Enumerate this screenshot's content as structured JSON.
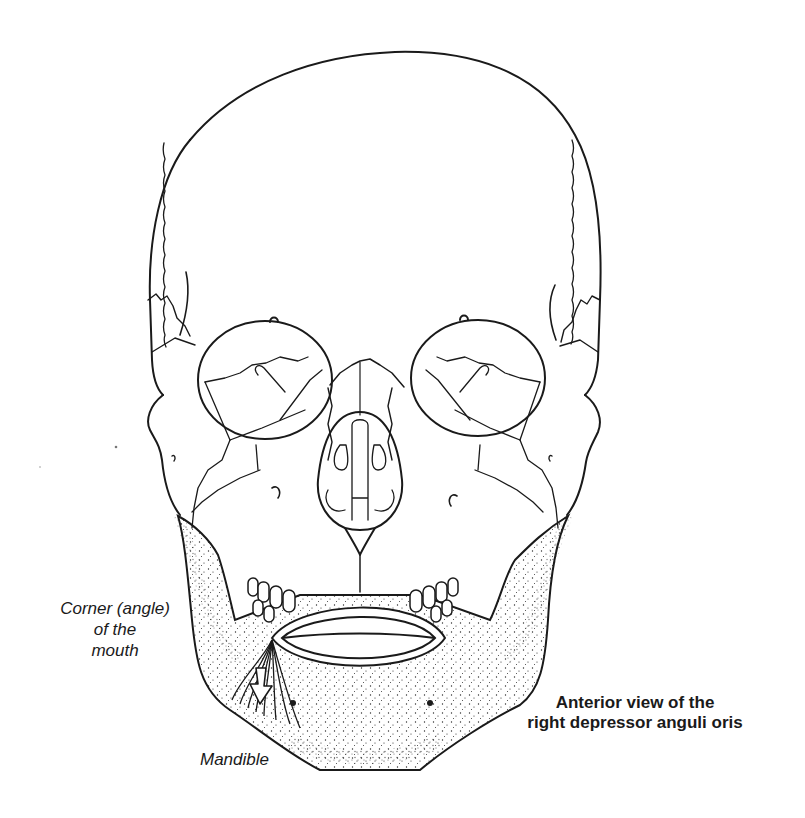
{
  "figure": {
    "caption": {
      "line1": "Anterior view of the",
      "line2": "right depressor anguli oris"
    },
    "labels": {
      "corner_of_mouth": {
        "line1": "Corner (angle)",
        "line2": "of the",
        "line3": "mouth"
      },
      "mandible": "Mandible"
    },
    "annotations": {
      "muscle": "depressor anguli oris",
      "arrow_direction": "down",
      "arrow_meaning": "direction of pull"
    },
    "colors": {
      "stroke": "#1a1a1a",
      "background": "#ffffff",
      "stipple": "#2a2a2a"
    }
  }
}
